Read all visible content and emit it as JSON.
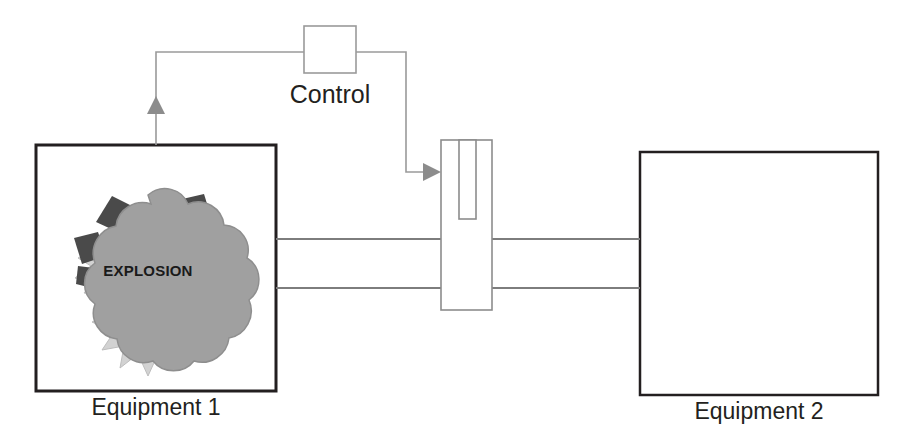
{
  "diagram": {
    "colors": {
      "equipment_border": "#231f20",
      "thin_line": "#9a9a9a",
      "valve_border": "#8c8c8c",
      "arrow_fill": "#8c8c8c",
      "explosion_cloud": "#a0a0a0",
      "explosion_burst": "#d2d2d2",
      "explosion_debris": "#4a4a4a",
      "text": "#231f20",
      "background": "#ffffff"
    },
    "nodes": {
      "equipment1": {
        "label": "Equipment 1",
        "shape": "rectangle",
        "x": 36,
        "y": 145,
        "width": 240,
        "height": 246,
        "border_weight": "thick"
      },
      "equipment2": {
        "label": "Equipment 2",
        "shape": "rectangle",
        "x": 640,
        "y": 152,
        "width": 238,
        "height": 243,
        "border_weight": "thick"
      },
      "control": {
        "label": "Control",
        "shape": "square",
        "x": 304,
        "y": 26,
        "width": 52,
        "height": 47,
        "border_weight": "thin"
      },
      "valve": {
        "label": "valve",
        "shape": "rectangle-with-stem",
        "x": 441,
        "y": 140,
        "width": 51,
        "height": 170,
        "stem": {
          "x": 459,
          "y": 140,
          "width": 17,
          "height": 79
        }
      },
      "explosion": {
        "label": "EXPLOSION",
        "shape": "explosion-burst-cloud",
        "center_x": 148,
        "center_y": 268,
        "width": 150,
        "height": 155
      }
    },
    "connections": [
      {
        "name": "equipment1-to-control",
        "from": "equipment1",
        "to": "control",
        "style": "thin-gray",
        "arrowhead": "up-into-equipment1",
        "arrow_x": 156,
        "arrow_tip_y": 97
      },
      {
        "name": "control-to-valve",
        "from": "control",
        "to": "valve",
        "style": "thin-gray",
        "arrowhead": "right-into-valve",
        "arrow_y": 172,
        "arrow_tip_x": 441
      },
      {
        "name": "duct-equipment1-to-valve",
        "from": "equipment1",
        "to": "valve",
        "style": "double-line-duct",
        "line_y_top": 239,
        "line_y_bottom": 288
      },
      {
        "name": "duct-valve-to-equipment2",
        "from": "valve",
        "to": "equipment2",
        "style": "double-line-duct",
        "line_y_top": 239,
        "line_y_bottom": 288
      }
    ]
  },
  "labels": {
    "equipment1": "Equipment 1",
    "equipment2": "Equipment 2",
    "control": "Control",
    "explosion": "EXPLOSION"
  }
}
